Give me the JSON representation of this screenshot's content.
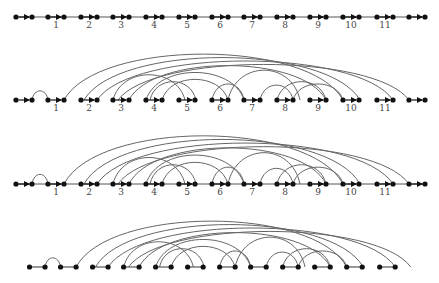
{
  "diagram": {
    "colors": {
      "node": "#111111",
      "edge": "#555555",
      "arc": "#666666",
      "label": "#444444"
    },
    "pair_x": [
      [
        16,
        32
      ],
      [
        48,
        64
      ],
      [
        81,
        97
      ],
      [
        113,
        129
      ],
      [
        146,
        162
      ],
      [
        179,
        195
      ],
      [
        212,
        228
      ],
      [
        244,
        260
      ],
      [
        277,
        293
      ],
      [
        310,
        326
      ],
      [
        343,
        359
      ],
      [
        377,
        393
      ],
      [
        409,
        425
      ]
    ],
    "labels": [
      "1",
      "2",
      "3",
      "4",
      "5",
      "6",
      "7",
      "8",
      "9",
      "10",
      "11"
    ],
    "rows": [
      {
        "id": "row1",
        "y": 17,
        "label_y": 28,
        "arrows": true,
        "baseline": true,
        "labels": true,
        "arcs": false,
        "x_offset": 0
      },
      {
        "id": "row2",
        "y": 100,
        "label_y": 111,
        "arrows": true,
        "baseline": false,
        "labels": true,
        "arcs": true,
        "x_offset": 0,
        "arc_scale": 1.0
      },
      {
        "id": "row3",
        "y": 184,
        "label_y": 195,
        "arrows": true,
        "baseline": true,
        "labels": true,
        "arcs": true,
        "x_offset": 0,
        "arc_scale": 1.05
      },
      {
        "id": "row4",
        "y": 267,
        "label_y": null,
        "arrows": false,
        "baseline": false,
        "labels": false,
        "arcs": true,
        "x_offset": 14,
        "pair_subset": [
          1,
          12
        ],
        "arc_scale": 1.0,
        "compress": 0.97
      }
    ],
    "arcs": [
      [
        32,
        48,
        8
      ],
      [
        64,
        343,
        40
      ],
      [
        84,
        360,
        37
      ],
      [
        97,
        393,
        34
      ],
      [
        118,
        409,
        31
      ],
      [
        129,
        326,
        30
      ],
      [
        113,
        185,
        22
      ],
      [
        146,
        244,
        24
      ],
      [
        162,
        228,
        18
      ],
      [
        150,
        196,
        16
      ],
      [
        212,
        244,
        14
      ],
      [
        228,
        300,
        26
      ],
      [
        260,
        293,
        13
      ],
      [
        277,
        326,
        16
      ],
      [
        293,
        343,
        14
      ]
    ]
  }
}
